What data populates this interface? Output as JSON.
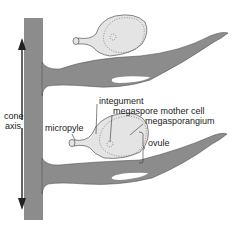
{
  "diagram": {
    "labels": {
      "cone_axis_line1": "cone",
      "cone_axis_line2": "axis",
      "micropyle": "micropyle",
      "integument": "integument",
      "megaspore_mother_cell": "megaspore mother cell",
      "megasporangium": "megasporangium",
      "ovule": "ovule"
    },
    "colors": {
      "tissue_gray": "#8c8c8c",
      "ovule_fill": "#e4e4e4",
      "outline": "#555555",
      "text": "#222222"
    },
    "elements": [
      "cone-axis",
      "upper-scale",
      "upper-ovule",
      "lower-scale",
      "lower-ovule",
      "double-arrow",
      "ovule-bracket"
    ]
  }
}
